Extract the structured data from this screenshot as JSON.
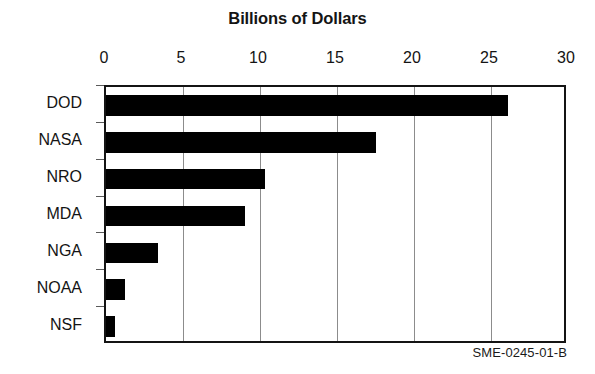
{
  "chart_data": {
    "type": "bar",
    "orientation": "horizontal",
    "title": "Billions of Dollars",
    "xlabel": "",
    "ylabel": "",
    "categories": [
      "DOD",
      "NASA",
      "NRO",
      "MDA",
      "NGA",
      "NOAA",
      "NSF"
    ],
    "values": [
      26.1,
      17.5,
      10.3,
      9.0,
      3.4,
      1.2,
      0.6
    ],
    "xlim": [
      0,
      30
    ],
    "xticks": [
      0,
      5,
      10,
      15,
      20,
      25,
      30
    ],
    "xticklabels": [
      "0",
      "5",
      "10",
      "15",
      "20",
      "25",
      "30"
    ],
    "grid": "vertical",
    "legend": "none",
    "bar_color": "#000000",
    "background_color": "#ffffff",
    "gridline_color": "#8c8c8c",
    "axis_color": "#141414"
  },
  "caption": {
    "text": "SME-0245-01-B"
  }
}
